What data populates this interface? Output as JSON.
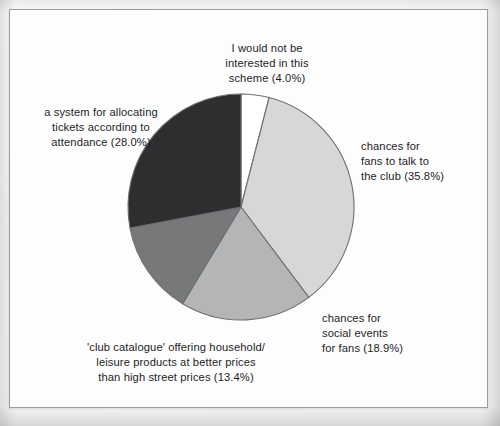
{
  "chart_data": {
    "type": "pie",
    "title": "",
    "subtitle": "",
    "xlabel": "",
    "ylabel": "",
    "legend_position": "labels-around-pie",
    "grid": false,
    "start_angle_deg": 0,
    "direction": "clockwise",
    "categories": [
      "I would not be interested in this scheme",
      "chances for fans to talk to the club",
      "chances for social events for fans",
      "'club catalogue' offering household/ leisure products at better prices than high street prices",
      "a system for allocating tickets according to attendance"
    ],
    "values": [
      4.0,
      35.8,
      18.9,
      13.4,
      28.0
    ],
    "units": "%",
    "colors": [
      "#ffffff",
      "#d5d7d9",
      "#b3b5b7",
      "#76787a",
      "#2e2e30"
    ],
    "slices": [
      {
        "label": "I would not be interested in this scheme",
        "label_lines": "I would not be\ninterested in this\nscheme (4.0%)",
        "value": 4.0,
        "color": "#ffffff"
      },
      {
        "label": "chances for fans to talk to the club",
        "label_lines": "chances for\nfans to talk to\nthe club (35.8%)",
        "value": 35.8,
        "color": "#d5d7d9"
      },
      {
        "label": "chances for social events for fans",
        "label_lines": "chances for\nsocial events\nfor fans (18.9%)",
        "value": 18.9,
        "color": "#b3b5b7"
      },
      {
        "label": "'club catalogue' offering household/ leisure products at better prices than high street prices",
        "label_lines": "'club catalogue' offering household/\nleisure products at better prices\nthan high street prices (13.4%)",
        "value": 13.4,
        "color": "#76787a"
      },
      {
        "label": "a system for allocating tickets according to attendance",
        "label_lines": "a system for allocating\ntickets according to\nattendance (28.0%)",
        "value": 28.0,
        "color": "#2e2e30"
      }
    ]
  },
  "figure": {
    "border_color": "#9a9d9f",
    "background_color": "#fdfdfd",
    "outline_color": "#6d6f71",
    "text_color": "#1d1d1f"
  }
}
